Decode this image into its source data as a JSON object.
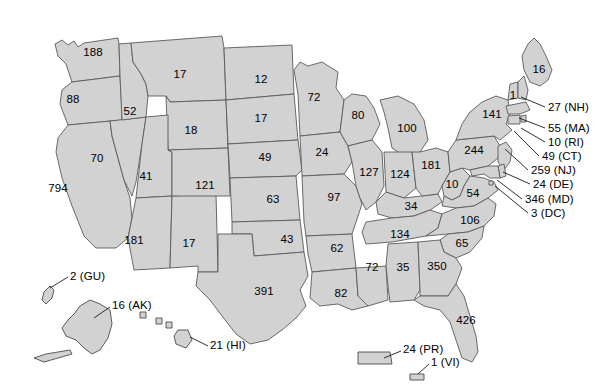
{
  "figure": {
    "type": "choropleth-map",
    "region": "United States with territories",
    "width": 616,
    "height": 391,
    "background_color": "#ffffff",
    "state_fill_color": "#d2d2d2",
    "state_border_color": "#5a5a5a",
    "label_color": "#000000"
  },
  "chart_data": {
    "type": "map",
    "title": "",
    "subtitle": "",
    "xlabel": "",
    "ylabel": "",
    "legend": [],
    "grid": false,
    "map_kind": "us-states-labeled-counts",
    "label_style": "numeric value printed inside each state; small states use leader-line callouts with state abbreviation in parentheses",
    "categories": [
      "WA",
      "OR",
      "CA",
      "NV",
      "ID",
      "MT",
      "WY",
      "UT",
      "AZ",
      "NM",
      "CO",
      "ND",
      "SD",
      "NE",
      "KS",
      "OK",
      "TX",
      "MN",
      "IA",
      "MO",
      "AR",
      "LA",
      "WI",
      "IL",
      "MS",
      "MI",
      "IN",
      "KY",
      "TN",
      "AL",
      "OH",
      "WV",
      "VA",
      "NC",
      "SC",
      "GA",
      "FL",
      "PA",
      "NY",
      "ME",
      "VT",
      "NH",
      "MA",
      "RI",
      "CT",
      "NJ",
      "DE",
      "MD",
      "DC",
      "AK",
      "HI",
      "GU",
      "PR",
      "VI"
    ],
    "values": [
      188,
      88,
      794,
      70,
      52,
      17,
      18,
      41,
      181,
      17,
      121,
      12,
      17,
      49,
      63,
      43,
      391,
      72,
      24,
      97,
      62,
      82,
      80,
      127,
      72,
      100,
      124,
      34,
      134,
      35,
      181,
      10,
      54,
      106,
      65,
      350,
      426,
      244,
      141,
      16,
      1,
      27,
      55,
      10,
      49,
      259,
      24,
      346,
      3,
      16,
      21,
      2,
      24,
      1
    ]
  },
  "states": [
    {
      "abbr": "WA",
      "value": "188",
      "x": 93,
      "y": 52
    },
    {
      "abbr": "OR",
      "value": "88",
      "x": 73,
      "y": 99
    },
    {
      "abbr": "CA",
      "value": "794",
      "x": 58,
      "y": 188
    },
    {
      "abbr": "NV",
      "value": "70",
      "x": 97,
      "y": 158
    },
    {
      "abbr": "ID",
      "value": "52",
      "x": 130,
      "y": 111
    },
    {
      "abbr": "MT",
      "value": "17",
      "x": 180,
      "y": 74
    },
    {
      "abbr": "WY",
      "value": "18",
      "x": 191,
      "y": 130
    },
    {
      "abbr": "UT",
      "value": "41",
      "x": 146,
      "y": 176
    },
    {
      "abbr": "AZ",
      "value": "181",
      "x": 134,
      "y": 240
    },
    {
      "abbr": "NM",
      "value": "17",
      "x": 189,
      "y": 243
    },
    {
      "abbr": "CO",
      "value": "121",
      "x": 205,
      "y": 185
    },
    {
      "abbr": "ND",
      "value": "12",
      "x": 261,
      "y": 79
    },
    {
      "abbr": "SD",
      "value": "17",
      "x": 261,
      "y": 118
    },
    {
      "abbr": "NE",
      "value": "49",
      "x": 265,
      "y": 157
    },
    {
      "abbr": "KS",
      "value": "63",
      "x": 273,
      "y": 199
    },
    {
      "abbr": "OK",
      "value": "43",
      "x": 287,
      "y": 239
    },
    {
      "abbr": "TX",
      "value": "391",
      "x": 264,
      "y": 291
    },
    {
      "abbr": "MN",
      "value": "72",
      "x": 314,
      "y": 97
    },
    {
      "abbr": "IA",
      "value": "24",
      "x": 322,
      "y": 152
    },
    {
      "abbr": "MO",
      "value": "97",
      "x": 334,
      "y": 197
    },
    {
      "abbr": "AR",
      "value": "62",
      "x": 337,
      "y": 248
    },
    {
      "abbr": "LA",
      "value": "82",
      "x": 341,
      "y": 293
    },
    {
      "abbr": "WI",
      "value": "80",
      "x": 358,
      "y": 115
    },
    {
      "abbr": "IL",
      "value": "127",
      "x": 369,
      "y": 172
    },
    {
      "abbr": "MS",
      "value": "72",
      "x": 372,
      "y": 267
    },
    {
      "abbr": "MI",
      "value": "100",
      "x": 407,
      "y": 128
    },
    {
      "abbr": "IN",
      "value": "124",
      "x": 400,
      "y": 174
    },
    {
      "abbr": "KY",
      "value": "34",
      "x": 411,
      "y": 206
    },
    {
      "abbr": "TN",
      "value": "134",
      "x": 400,
      "y": 234
    },
    {
      "abbr": "AL",
      "value": "35",
      "x": 403,
      "y": 267
    },
    {
      "abbr": "OH",
      "value": "181",
      "x": 431,
      "y": 165
    },
    {
      "abbr": "WV",
      "value": "10",
      "x": 452,
      "y": 184
    },
    {
      "abbr": "VA",
      "value": "54",
      "x": 473,
      "y": 193
    },
    {
      "abbr": "NC",
      "value": "106",
      "x": 470,
      "y": 220
    },
    {
      "abbr": "SC",
      "value": "65",
      "x": 462,
      "y": 243
    },
    {
      "abbr": "GA",
      "value": "350",
      "x": 437,
      "y": 266
    },
    {
      "abbr": "FL",
      "value": "426",
      "x": 466,
      "y": 320
    },
    {
      "abbr": "PA",
      "value": "244",
      "x": 474,
      "y": 150
    },
    {
      "abbr": "NY",
      "value": "141",
      "x": 492,
      "y": 114
    },
    {
      "abbr": "ME",
      "value": "16",
      "x": 539,
      "y": 69
    },
    {
      "abbr": "VT",
      "value": "1",
      "x": 513,
      "y": 95
    }
  ],
  "callouts": [
    {
      "abbr": "NH",
      "label": "27 (NH)",
      "label_x": 548,
      "label_y": 107,
      "line": "M 545 107 L 521 97"
    },
    {
      "abbr": "MA",
      "label": "55 (MA)",
      "label_x": 548,
      "label_y": 128,
      "line": "M 545 128 L 519 118"
    },
    {
      "abbr": "RI",
      "label": "10 (RI)",
      "label_x": 548,
      "label_y": 142,
      "line": "M 545 142 L 521 128"
    },
    {
      "abbr": "CT",
      "label": "49 (CT)",
      "label_x": 542,
      "label_y": 156,
      "line": "M 539 156 L 514 131"
    },
    {
      "abbr": "NJ",
      "label": "259 (NJ)",
      "label_x": 531,
      "label_y": 170,
      "line": "M 528 170 L 505 149"
    },
    {
      "abbr": "DE",
      "label": "24 (DE)",
      "label_x": 533,
      "label_y": 184,
      "line": "M 530 184 L 503 172"
    },
    {
      "abbr": "MD",
      "label": "346 (MD)",
      "label_x": 525,
      "label_y": 199,
      "line": "M 522 199 L 497 180"
    },
    {
      "abbr": "DC",
      "label": "3 (DC)",
      "label_x": 531,
      "label_y": 213,
      "line": "M 528 213 L 495 186"
    }
  ],
  "insets": [
    {
      "abbr": "GU",
      "label": "2 (GU)",
      "label_x": 70,
      "label_y": 276,
      "line": "M 68 277 L 50 288"
    },
    {
      "abbr": "AK",
      "label": "16 (AK)",
      "label_x": 112,
      "label_y": 305,
      "line": "M 110 307 L 94 318"
    },
    {
      "abbr": "HI",
      "label": "21 (HI)",
      "label_x": 210,
      "label_y": 345,
      "line": "M 208 346 L 190 337"
    },
    {
      "abbr": "PR",
      "label": "24 (PR)",
      "label_x": 403,
      "label_y": 349,
      "line": "M 401 351 L 384 358"
    },
    {
      "abbr": "VI",
      "label": "1 (VI)",
      "label_x": 431,
      "label_y": 362,
      "line": "M 429 364 L 418 374"
    }
  ]
}
